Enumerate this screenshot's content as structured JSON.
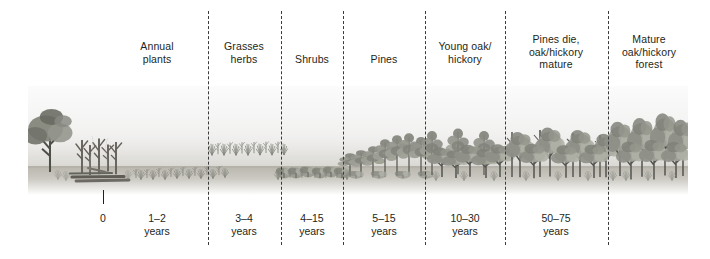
{
  "figure": {
    "palette": {
      "ink": "#231f20",
      "divider": "#3a3a3a",
      "sky": "#f4f4f4",
      "ground": "#b9b7ae",
      "foliage_dark": "#6f7168",
      "foliage_mid": "#93958b",
      "foliage_light": "#b6b8ad",
      "trunk": "#4a4a46",
      "snag": "#595751"
    }
  },
  "stages": [
    {
      "id": "annual-plants",
      "label_lines": [
        "Annual",
        "plants"
      ],
      "time_lines": [
        "1–2",
        "years"
      ],
      "label_center": 157,
      "time_center": 157
    },
    {
      "id": "grasses-herbs",
      "label_lines": [
        "Grasses",
        "herbs"
      ],
      "time_lines": [
        "3–4",
        "years"
      ],
      "label_center": 244,
      "time_center": 244
    },
    {
      "id": "shrubs",
      "label_lines": [
        "Shrubs"
      ],
      "time_lines": [
        "4–15",
        "years"
      ],
      "label_center": 312,
      "time_center": 312
    },
    {
      "id": "pines",
      "label_lines": [
        "Pines"
      ],
      "time_lines": [
        "5–15",
        "years"
      ],
      "label_center": 384,
      "time_center": 384
    },
    {
      "id": "young-oak-hickory",
      "label_lines": [
        "Young oak/",
        "hickory"
      ],
      "time_lines": [
        "10–30",
        "years"
      ],
      "label_center": 465,
      "time_center": 465
    },
    {
      "id": "pines-die-oak-hickory-mature",
      "label_lines": [
        "Pines die,",
        "oak/hickory",
        "mature"
      ],
      "time_lines": [
        "50–75",
        "years"
      ],
      "label_center": 556,
      "time_center": 556
    },
    {
      "id": "mature-oak-hickory-forest",
      "label_lines": [
        "Mature",
        "oak/hickory",
        "forest"
      ],
      "time_lines": [],
      "label_center": 649,
      "time_center": 649
    }
  ],
  "dividers": [
    208,
    281,
    343,
    425,
    505,
    608
  ],
  "axis": {
    "origin_label": "0",
    "origin_x": 103,
    "unit_word": "years"
  },
  "chart_data": {
    "type": "table",
    "xlabel": "Time since disturbance (years)",
    "ylabel": "",
    "categories": [
      "Annual plants",
      "Grasses herbs",
      "Shrubs",
      "Pines",
      "Young oak/hickory",
      "Pines die, oak/hickory mature",
      "Mature oak/hickory forest"
    ],
    "time_ranges": [
      "1–2",
      "3–4",
      "4–15",
      "5–15",
      "10–30",
      "50–75",
      ""
    ],
    "time_start_years": [
      1,
      3,
      4,
      5,
      10,
      50,
      null
    ],
    "time_end_years": [
      2,
      4,
      15,
      15,
      30,
      75,
      null
    ],
    "origin": 0,
    "grid": false,
    "legend": "none"
  }
}
